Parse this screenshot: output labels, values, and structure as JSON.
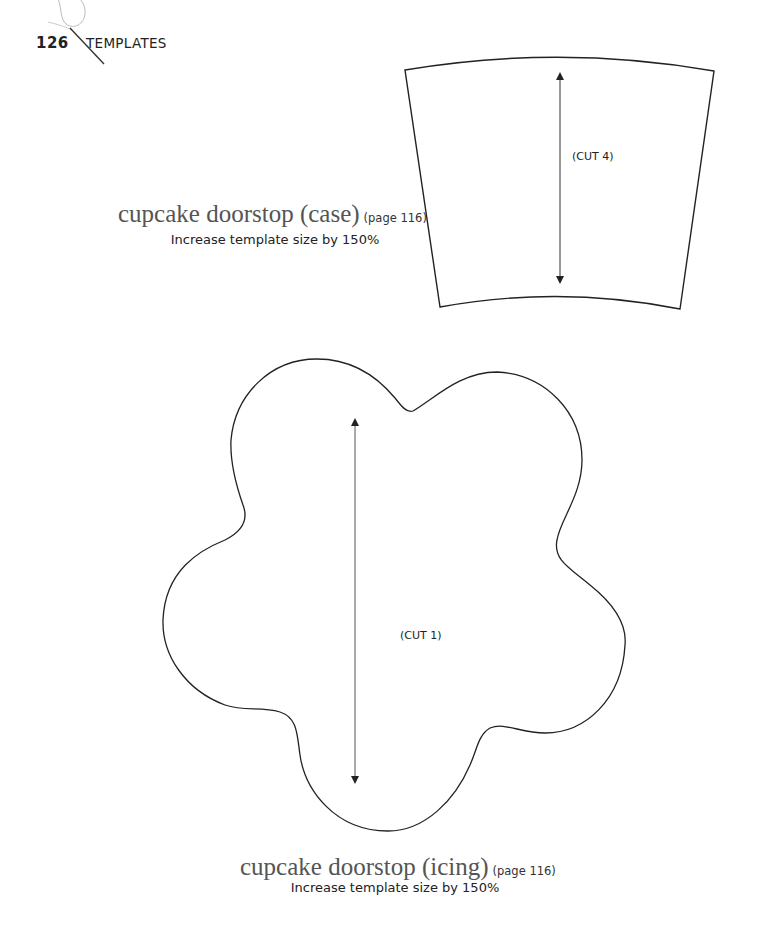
{
  "header": {
    "page_number": "126",
    "section": "TEMPLATES",
    "icon": "needle-thread-icon"
  },
  "templates": [
    {
      "title": "cupcake doorstop (case)",
      "page_ref": "(page 116)",
      "instruction": "Increase template size by 150%",
      "cut_label": "(CUT 4)",
      "shape": "curved-trapezoid"
    },
    {
      "title": "cupcake doorstop (icing)",
      "page_ref": "(page 116)",
      "instruction": "Increase template size by 150%",
      "cut_label": "(CUT 1)",
      "shape": "five-lobed-flower"
    }
  ],
  "colors": {
    "outline": "#222222",
    "title_gray": "#555555",
    "thread": "#bbbbbb"
  }
}
